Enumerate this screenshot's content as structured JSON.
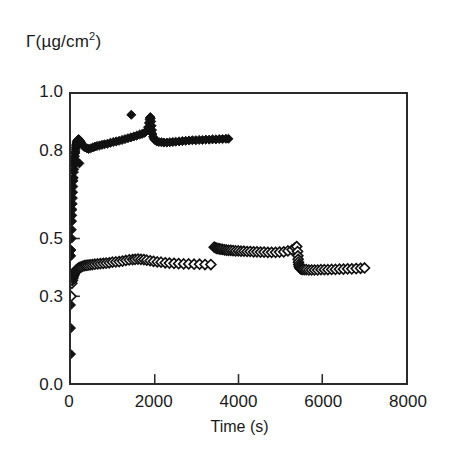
{
  "chart_data": {
    "type": "scatter",
    "title": "",
    "xlabel": "Time (s)",
    "ylabel": "Γ(µg/cm2)",
    "ylabel_base": "Γ(µg/cm",
    "ylabel_exp": "2",
    "ylabel_close": ")",
    "xlim": [
      0,
      8000
    ],
    "ylim": [
      0.0,
      1.0
    ],
    "xticks": [
      0,
      2000,
      4000,
      6000,
      8000
    ],
    "xtick_labels": [
      "0",
      "2000",
      "4000",
      "6000",
      "8000"
    ],
    "yticks": [
      0.0,
      0.3,
      0.5,
      0.8,
      1.0
    ],
    "ytick_labels": [
      "0.0",
      "0.3",
      "0.5",
      "0.8",
      "1.0"
    ],
    "grid": false,
    "legend": "none",
    "marker_color": "#111111",
    "series": [
      {
        "name": "filled-diamond-series",
        "marker": "filled-diamond",
        "fill": "#111111",
        "stroke": "#111111",
        "points": [
          [
            0,
            0.1
          ],
          [
            0,
            0.19
          ],
          [
            0,
            0.27
          ],
          [
            0,
            0.36
          ],
          [
            5,
            0.44
          ],
          [
            10,
            0.46
          ],
          [
            15,
            0.5
          ],
          [
            20,
            0.53
          ],
          [
            25,
            0.56
          ],
          [
            30,
            0.58
          ],
          [
            35,
            0.6
          ],
          [
            40,
            0.62
          ],
          [
            45,
            0.64
          ],
          [
            50,
            0.66
          ],
          [
            55,
            0.68
          ],
          [
            60,
            0.7
          ],
          [
            65,
            0.71
          ],
          [
            70,
            0.73
          ],
          [
            75,
            0.74
          ],
          [
            80,
            0.755
          ],
          [
            85,
            0.765
          ],
          [
            90,
            0.775
          ],
          [
            95,
            0.785
          ],
          [
            100,
            0.795
          ],
          [
            105,
            0.8
          ],
          [
            110,
            0.808
          ],
          [
            115,
            0.815
          ],
          [
            120,
            0.82
          ],
          [
            125,
            0.825
          ],
          [
            130,
            0.83
          ],
          [
            140,
            0.835
          ],
          [
            150,
            0.838
          ],
          [
            160,
            0.84
          ],
          [
            170,
            0.842
          ],
          [
            180,
            0.843
          ],
          [
            190,
            0.843
          ],
          [
            200,
            0.76
          ],
          [
            210,
            0.838
          ],
          [
            230,
            0.835
          ],
          [
            250,
            0.83
          ],
          [
            280,
            0.822
          ],
          [
            310,
            0.818
          ],
          [
            340,
            0.815
          ],
          [
            380,
            0.812
          ],
          [
            420,
            0.81
          ],
          [
            470,
            0.812
          ],
          [
            520,
            0.815
          ],
          [
            570,
            0.818
          ],
          [
            620,
            0.82
          ],
          [
            680,
            0.822
          ],
          [
            740,
            0.824
          ],
          [
            800,
            0.826
          ],
          [
            870,
            0.828
          ],
          [
            940,
            0.831
          ],
          [
            1010,
            0.834
          ],
          [
            1080,
            0.836
          ],
          [
            1150,
            0.838
          ],
          [
            1220,
            0.841
          ],
          [
            1290,
            0.844
          ],
          [
            1360,
            0.847
          ],
          [
            1430,
            0.85
          ],
          [
            1440,
            0.928
          ],
          [
            1500,
            0.853
          ],
          [
            1570,
            0.856
          ],
          [
            1640,
            0.86
          ],
          [
            1700,
            0.862
          ],
          [
            1760,
            0.866
          ],
          [
            1800,
            0.872
          ],
          [
            1840,
            0.885
          ],
          [
            1860,
            0.9
          ],
          [
            1875,
            0.912
          ],
          [
            1885,
            0.918
          ],
          [
            1895,
            0.92
          ],
          [
            1905,
            0.916
          ],
          [
            1915,
            0.905
          ],
          [
            1925,
            0.89
          ],
          [
            1935,
            0.875
          ],
          [
            1945,
            0.862
          ],
          [
            1960,
            0.852
          ],
          [
            1980,
            0.845
          ],
          [
            2010,
            0.84
          ],
          [
            2050,
            0.836
          ],
          [
            2100,
            0.834
          ],
          [
            2160,
            0.833
          ],
          [
            2220,
            0.832
          ],
          [
            2290,
            0.832
          ],
          [
            2360,
            0.833
          ],
          [
            2430,
            0.834
          ],
          [
            2500,
            0.835
          ],
          [
            2580,
            0.836
          ],
          [
            2660,
            0.837
          ],
          [
            2740,
            0.838
          ],
          [
            2820,
            0.839
          ],
          [
            2900,
            0.84
          ],
          [
            2980,
            0.84
          ],
          [
            3060,
            0.841
          ],
          [
            3140,
            0.841
          ],
          [
            3220,
            0.842
          ],
          [
            3300,
            0.842
          ],
          [
            3380,
            0.843
          ],
          [
            3460,
            0.843
          ],
          [
            3540,
            0.844
          ],
          [
            3620,
            0.844
          ],
          [
            3700,
            0.845
          ],
          [
            3760,
            0.845
          ]
        ]
      },
      {
        "name": "open-diamond-series",
        "marker": "open-diamond",
        "fill": "#ffffff",
        "stroke": "#111111",
        "points": [
          [
            0,
            0.3
          ],
          [
            20,
            0.345
          ],
          [
            30,
            0.355
          ],
          [
            40,
            0.362
          ],
          [
            50,
            0.368
          ],
          [
            60,
            0.372
          ],
          [
            70,
            0.376
          ],
          [
            80,
            0.379
          ],
          [
            90,
            0.382
          ],
          [
            100,
            0.385
          ],
          [
            115,
            0.388
          ],
          [
            130,
            0.391
          ],
          [
            150,
            0.394
          ],
          [
            170,
            0.396
          ],
          [
            190,
            0.398
          ],
          [
            215,
            0.4
          ],
          [
            245,
            0.402
          ],
          [
            280,
            0.404
          ],
          [
            320,
            0.406
          ],
          [
            360,
            0.407
          ],
          [
            405,
            0.408
          ],
          [
            455,
            0.409
          ],
          [
            510,
            0.41
          ],
          [
            570,
            0.411
          ],
          [
            635,
            0.412
          ],
          [
            700,
            0.413
          ],
          [
            770,
            0.414
          ],
          [
            840,
            0.415
          ],
          [
            915,
            0.416
          ],
          [
            990,
            0.418
          ],
          [
            1070,
            0.419
          ],
          [
            1150,
            0.42
          ],
          [
            1230,
            0.422
          ],
          [
            1310,
            0.424
          ],
          [
            1390,
            0.426
          ],
          [
            1470,
            0.427
          ],
          [
            1530,
            0.428
          ],
          [
            1600,
            0.429
          ],
          [
            1670,
            0.428
          ],
          [
            1740,
            0.427
          ],
          [
            1810,
            0.425
          ],
          [
            1890,
            0.423
          ],
          [
            1970,
            0.421
          ],
          [
            2060,
            0.419
          ],
          [
            2150,
            0.418
          ],
          [
            2250,
            0.416
          ],
          [
            2350,
            0.415
          ],
          [
            2460,
            0.414
          ],
          [
            2570,
            0.413
          ],
          [
            2690,
            0.412
          ],
          [
            2810,
            0.412
          ],
          [
            2940,
            0.411
          ],
          [
            3070,
            0.411
          ],
          [
            3200,
            0.41
          ],
          [
            3340,
            0.41
          ],
          [
            3420,
            0.47
          ],
          [
            3450,
            0.468
          ],
          [
            3480,
            0.466
          ],
          [
            3510,
            0.465
          ],
          [
            3545,
            0.464
          ],
          [
            3580,
            0.463
          ],
          [
            3620,
            0.462
          ],
          [
            3665,
            0.461
          ],
          [
            3710,
            0.46
          ],
          [
            3760,
            0.459
          ],
          [
            3815,
            0.459
          ],
          [
            3870,
            0.458
          ],
          [
            3930,
            0.457
          ],
          [
            3995,
            0.457
          ],
          [
            4060,
            0.456
          ],
          [
            4130,
            0.456
          ],
          [
            4205,
            0.455
          ],
          [
            4280,
            0.455
          ],
          [
            4360,
            0.454
          ],
          [
            4440,
            0.454
          ],
          [
            4525,
            0.453
          ],
          [
            4610,
            0.453
          ],
          [
            4700,
            0.452
          ],
          [
            4790,
            0.452
          ],
          [
            4885,
            0.452
          ],
          [
            4980,
            0.453
          ],
          [
            5080,
            0.454
          ],
          [
            5180,
            0.457
          ],
          [
            5280,
            0.461
          ],
          [
            5350,
            0.468
          ],
          [
            5390,
            0.472
          ],
          [
            5410,
            0.455
          ],
          [
            5418,
            0.44
          ],
          [
            5425,
            0.428
          ],
          [
            5432,
            0.418
          ],
          [
            5440,
            0.41
          ],
          [
            5450,
            0.404
          ],
          [
            5462,
            0.399
          ],
          [
            5478,
            0.396
          ],
          [
            5500,
            0.394
          ],
          [
            5530,
            0.393
          ],
          [
            5570,
            0.392
          ],
          [
            5620,
            0.392
          ],
          [
            5680,
            0.391
          ],
          [
            5745,
            0.391
          ],
          [
            5815,
            0.391
          ],
          [
            5890,
            0.391
          ],
          [
            5970,
            0.392
          ],
          [
            6050,
            0.392
          ],
          [
            6135,
            0.392
          ],
          [
            6225,
            0.393
          ],
          [
            6315,
            0.393
          ],
          [
            6410,
            0.394
          ],
          [
            6505,
            0.394
          ],
          [
            6605,
            0.395
          ],
          [
            6705,
            0.395
          ],
          [
            6810,
            0.396
          ],
          [
            6915,
            0.397
          ],
          [
            7010,
            0.398
          ]
        ]
      }
    ]
  }
}
